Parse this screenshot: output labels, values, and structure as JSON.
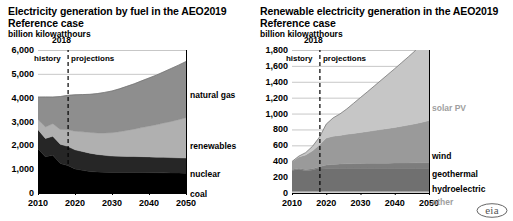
{
  "source_logo": "eia",
  "charts": [
    {
      "id": "electricity-generation-by-fuel",
      "title": "Electricity generation by fuel in the AEO2019 Reference case",
      "subtitle": "billion kilowatthours",
      "annotations": {
        "year": "2018",
        "history": "history",
        "projections": "projections"
      },
      "chart_data": {
        "type": "area",
        "stacked": true,
        "title": "Electricity generation by fuel in the AEO2019 Reference case",
        "xlabel": "",
        "ylabel": "billion kilowatthours",
        "ylim": [
          0,
          6000
        ],
        "xlim": [
          2010,
          2050
        ],
        "yticks": [
          "0",
          "1,000",
          "2,000",
          "3,000",
          "4,000",
          "5,000",
          "6,000"
        ],
        "ytick_values": [
          0,
          1000,
          2000,
          3000,
          4000,
          5000,
          6000
        ],
        "xticks": [
          "2010",
          "2020",
          "2030",
          "2040",
          "2050"
        ],
        "xtick_values": [
          2010,
          2020,
          2030,
          2040,
          2050
        ],
        "grid": true,
        "legend_position": "right-inline",
        "divider_year": 2018,
        "x": [
          2010,
          2012,
          2014,
          2016,
          2018,
          2020,
          2022,
          2024,
          2026,
          2028,
          2030,
          2032,
          2034,
          2036,
          2038,
          2040,
          2042,
          2044,
          2046,
          2048,
          2050
        ],
        "series": [
          {
            "name": "coal",
            "color": "#000000",
            "values": [
              1850,
              1520,
              1580,
              1240,
              1150,
              1010,
              950,
              900,
              880,
              870,
              860,
              860,
              860,
              860,
              860,
              855,
              850,
              845,
              840,
              835,
              830
            ]
          },
          {
            "name": "nuclear",
            "color": "#262626",
            "values": [
              807,
              769,
              797,
              806,
              807,
              800,
              790,
              770,
              740,
              710,
              690,
              680,
              675,
              670,
              665,
              660,
              655,
              650,
              645,
              640,
              635
            ]
          },
          {
            "name": "renewables",
            "color": "#b0b0b0",
            "values": [
              430,
              480,
              530,
              620,
              700,
              780,
              830,
              870,
              900,
              940,
              980,
              1030,
              1090,
              1150,
              1220,
              1290,
              1360,
              1440,
              1520,
              1600,
              1690
            ]
          },
          {
            "name": "natural gas",
            "color": "#8e8e8e",
            "values": [
              940,
              1260,
              1120,
              1380,
              1440,
              1530,
              1560,
              1600,
              1650,
              1700,
              1750,
              1800,
              1850,
              1900,
              1960,
              2020,
              2080,
              2150,
              2220,
              2290,
              2360
            ]
          }
        ]
      },
      "series_labels": [
        {
          "name": "natural gas",
          "style": "dark"
        },
        {
          "name": "renewables",
          "style": "dark"
        },
        {
          "name": "nuclear",
          "style": "dark"
        },
        {
          "name": "coal",
          "style": "dark"
        }
      ]
    },
    {
      "id": "renewable-electricity-generation",
      "title": "Renewable electricity generation in the AEO2019 Reference case",
      "subtitle": "billion kilowatthours",
      "annotations": {
        "year": "2018",
        "history": "history",
        "projections": "projections"
      },
      "chart_data": {
        "type": "area",
        "stacked": true,
        "title": "Renewable electricity generation in the AEO2019 Reference case",
        "xlabel": "",
        "ylabel": "billion kilowatthours",
        "ylim": [
          0,
          1800
        ],
        "xlim": [
          2010,
          2050
        ],
        "yticks": [
          "0",
          "200",
          "400",
          "600",
          "800",
          "1,000",
          "1,200",
          "1,400",
          "1,600",
          "1,800"
        ],
        "ytick_values": [
          0,
          200,
          400,
          600,
          800,
          1000,
          1200,
          1400,
          1600,
          1800
        ],
        "xticks": [
          "2010",
          "2020",
          "2030",
          "2040",
          "2050"
        ],
        "xtick_values": [
          2010,
          2020,
          2030,
          2040,
          2050
        ],
        "grid": true,
        "legend_position": "right-inline",
        "divider_year": 2018,
        "x": [
          2010,
          2012,
          2014,
          2016,
          2018,
          2020,
          2022,
          2024,
          2026,
          2028,
          2030,
          2032,
          2034,
          2036,
          2038,
          2040,
          2042,
          2044,
          2046,
          2048,
          2050
        ],
        "series": [
          {
            "name": "other",
            "color": "#cfcfcf",
            "values": [
              22,
              22,
              22,
              22,
              22,
              22,
              22,
              22,
              22,
              22,
              22,
              22,
              22,
              22,
              22,
              22,
              22,
              22,
              22,
              22,
              22
            ]
          },
          {
            "name": "hydroelectric",
            "color": "#707070",
            "values": [
              260,
              276,
              259,
              267,
              292,
              290,
              288,
              288,
              288,
              288,
              288,
              288,
              288,
              288,
              288,
              288,
              288,
              288,
              288,
              288,
              288
            ]
          },
          {
            "name": "geothermal",
            "color": "#7d7d7d",
            "values": [
              15,
              15,
              16,
              16,
              16,
              40,
              50,
              55,
              58,
              60,
              62,
              63,
              64,
              65,
              66,
              67,
              68,
              69,
              70,
              71,
              72
            ]
          },
          {
            "name": "wind",
            "color": "#9a9a9a",
            "values": [
              95,
              141,
              182,
              227,
              275,
              340,
              355,
              360,
              370,
              380,
              390,
              400,
              412,
              424,
              436,
              448,
              462,
              476,
              492,
              510,
              530
            ]
          },
          {
            "name": "solar PV",
            "color": "#c6c6c6",
            "values": [
              4,
              10,
              29,
              56,
              97,
              175,
              230,
              270,
              320,
              380,
              440,
              500,
              560,
              620,
              680,
              740,
              800,
              860,
              920,
              1000,
              1090
            ]
          }
        ]
      },
      "series_labels": [
        {
          "name": "solar PV",
          "style": "gray"
        },
        {
          "name": "wind",
          "style": "dark"
        },
        {
          "name": "geothermal",
          "style": "dark"
        },
        {
          "name": "hydroelectric",
          "style": "dark"
        },
        {
          "name": "other",
          "style": "gray"
        }
      ]
    }
  ]
}
